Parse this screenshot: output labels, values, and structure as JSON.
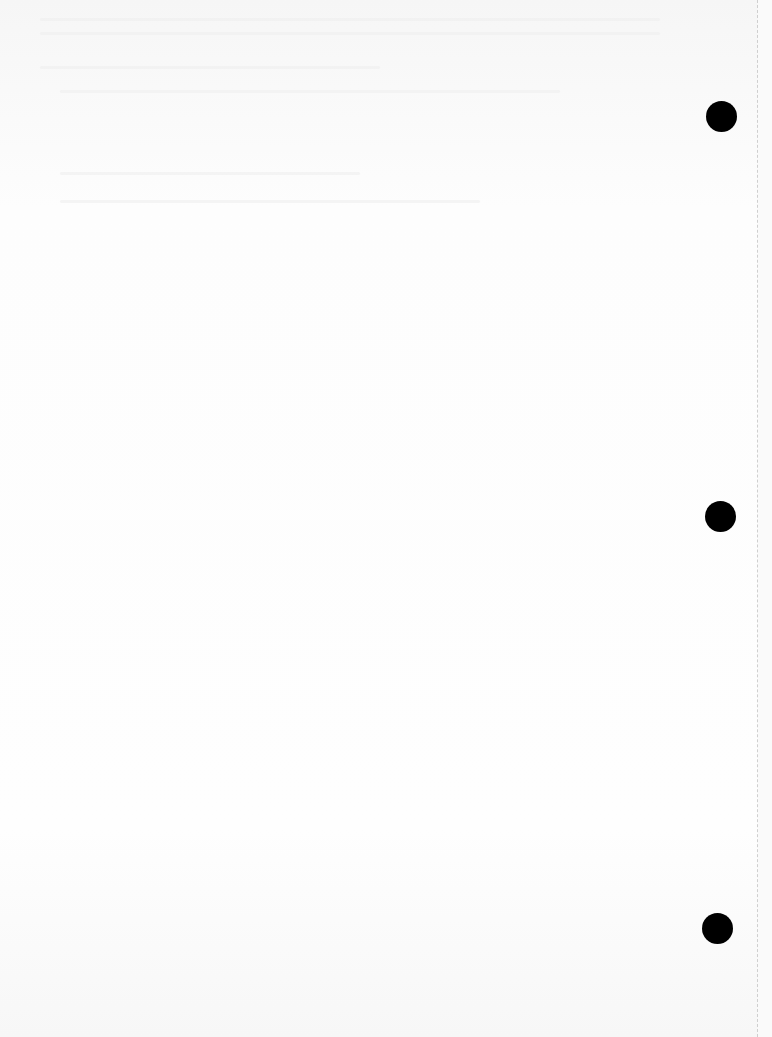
{
  "document": {
    "type": "blank scanned page",
    "visible_text": "",
    "punch_holes": [
      {
        "x": 721,
        "y": 116
      },
      {
        "x": 720,
        "y": 516
      },
      {
        "x": 717,
        "y": 928
      }
    ],
    "colors": {
      "paper": "#fdfdfd",
      "hole": "#000000",
      "edge": "#cfcfcf"
    }
  }
}
